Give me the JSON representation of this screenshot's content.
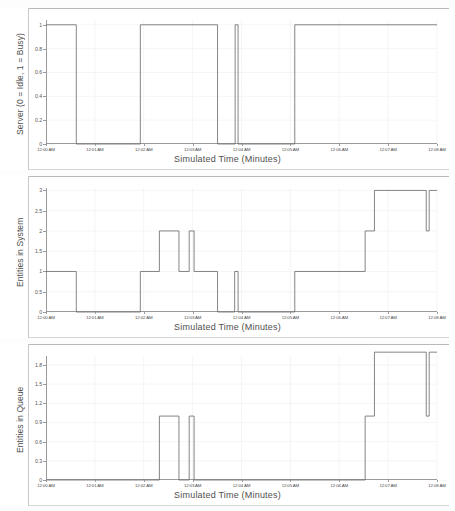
{
  "figure": {
    "background": "#ffffff",
    "line_color": "#6f6f6f",
    "axis_color": "#8e8e8e",
    "grid_color": "#eeeeee",
    "panel_count": 3
  },
  "shared": {
    "xlabel": "Simulated Time (Minutes)",
    "xticks": [
      "12:00 AM",
      "12:01 AM",
      "12:02 AM",
      "12:03 AM",
      "12:04 AM",
      "12:05 AM",
      "12:06 AM",
      "12:07 AM",
      "12:08 AM"
    ],
    "xlim": [
      0,
      8
    ]
  },
  "chart_data": [
    {
      "type": "line",
      "id": "server-utilization",
      "title": "",
      "xlabel": "Simulated Time (Minutes)",
      "ylabel": "Server (0 = Idle, 1 = Busy)",
      "xlim": [
        0,
        8
      ],
      "ylim": [
        0,
        1.04
      ],
      "grid": true,
      "legend": "none",
      "xticks": [
        "12:00 AM",
        "12:01 AM",
        "12:02 AM",
        "12:03 AM",
        "12:04 AM",
        "12:05 AM",
        "12:06 AM",
        "12:07 AM",
        "12:08 AM"
      ],
      "xtick_values": [
        0,
        1,
        2,
        3,
        4,
        5,
        6,
        7,
        8
      ],
      "yticks": [
        "0",
        "0.2",
        "0.4",
        "0.6",
        "0.8",
        "1"
      ],
      "ytick_values": [
        0,
        0.2,
        0.4,
        0.6,
        0.8,
        1
      ],
      "step": "post",
      "x": [
        0.0,
        0.62,
        0.62,
        1.93,
        1.93,
        3.51,
        3.51,
        3.87,
        3.87,
        3.93,
        3.93,
        5.09,
        5.09,
        8.0
      ],
      "y": [
        1,
        1,
        0,
        0,
        1,
        1,
        0,
        0,
        1,
        1,
        0,
        0,
        1,
        1
      ],
      "description": "Binary server state trace: busy 12:00-12:00:37, idle to 12:01:56, busy to 12:03:31, idle, brief busy spike near 12:03:52, idle to 12:05:05, busy through 12:08."
    },
    {
      "type": "line",
      "id": "entities-in-system",
      "title": "",
      "xlabel": "Simulated Time (Minutes)",
      "ylabel": "Entities in System",
      "xlim": [
        0,
        8
      ],
      "ylim": [
        0,
        3.06
      ],
      "grid": true,
      "legend": "none",
      "xticks": [
        "12:00 AM",
        "12:01 AM",
        "12:02 AM",
        "12:03 AM",
        "12:04 AM",
        "12:05 AM",
        "12:06 AM",
        "12:07 AM",
        "12:08 AM"
      ],
      "xtick_values": [
        0,
        1,
        2,
        3,
        4,
        5,
        6,
        7,
        8
      ],
      "yticks": [
        "0",
        "0.5",
        "1",
        "1.5",
        "2",
        "2.5",
        "3"
      ],
      "ytick_values": [
        0,
        0.5,
        1,
        1.5,
        2,
        2.5,
        3
      ],
      "step": "post",
      "x": [
        0.0,
        0.62,
        0.62,
        1.93,
        1.93,
        2.32,
        2.32,
        2.72,
        2.72,
        2.93,
        2.93,
        3.03,
        3.03,
        3.51,
        3.51,
        3.86,
        3.86,
        3.93,
        3.93,
        5.09,
        5.09,
        6.53,
        6.53,
        6.72,
        6.72,
        7.78,
        7.78,
        7.84,
        7.84,
        8.0
      ],
      "y": [
        1,
        1,
        0,
        0,
        1,
        1,
        2,
        2,
        1,
        1,
        2,
        2,
        1,
        1,
        0,
        0,
        1,
        1,
        0,
        0,
        1,
        1,
        2,
        2,
        3,
        3,
        2,
        2,
        3,
        3
      ],
      "description": "Count of entities in the system; ranges 0 to 3 with steps, a narrow spike to 1 near 12:03:52 and a narrow dip to 2 near 12:07:47."
    },
    {
      "type": "line",
      "id": "entities-in-queue",
      "title": "",
      "xlabel": "Simulated Time (Minutes)",
      "ylabel": "Entities in Queue",
      "xlim": [
        0,
        8
      ],
      "ylim": [
        0,
        1.94
      ],
      "grid": true,
      "legend": "none",
      "xticks": [
        "12:00 AM",
        "12:01 AM",
        "12:02 AM",
        "12:03 AM",
        "12:04 AM",
        "12:05 AM",
        "12:06 AM",
        "12:07 AM",
        "12:08 AM"
      ],
      "xtick_values": [
        0,
        1,
        2,
        3,
        4,
        5,
        6,
        7,
        8
      ],
      "yticks": [
        "0",
        "0.3",
        "0.6",
        "0.9",
        "1.2",
        "1.5",
        "1.8"
      ],
      "ytick_values": [
        0,
        0.3,
        0.6,
        0.9,
        1.2,
        1.5,
        1.8
      ],
      "step": "post",
      "x": [
        0.0,
        2.32,
        2.32,
        2.72,
        2.72,
        2.93,
        2.93,
        3.03,
        3.03,
        6.53,
        6.53,
        6.72,
        6.72,
        7.78,
        7.78,
        7.84,
        7.84,
        8.0
      ],
      "y": [
        0,
        0,
        1,
        1,
        0,
        0,
        1,
        1,
        0,
        0,
        1,
        1,
        2,
        2,
        1,
        1,
        2,
        2
      ],
      "description": "Queue length; 0 most of the run with two unit pulses near 12:02 and 12:03, then rises to 1 at ~12:06:32 and 2 from ~12:06:43 onward with a narrow dip near 12:07:47."
    }
  ]
}
